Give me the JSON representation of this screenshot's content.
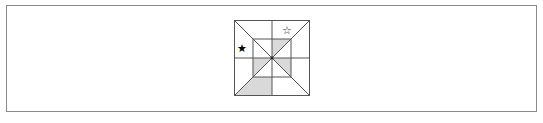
{
  "figure": {
    "outer_square": {
      "x": 234,
      "y": 20,
      "size": 76
    },
    "inner_square": {
      "x": 253,
      "y": 39,
      "size": 38
    },
    "line_color": "#555555",
    "shade_color": "#d9d9d9",
    "symbols": [
      {
        "name": "filled-star",
        "glyph": "★",
        "x": 242,
        "y": 48,
        "color": "#000000"
      },
      {
        "name": "hollow-star",
        "glyph": "☆",
        "x": 287,
        "y": 30,
        "color": "#333333"
      }
    ],
    "shaded_regions": [
      {
        "name": "top-right-inner-triangle",
        "points": "272,39 291,39 272,58"
      },
      {
        "name": "bottom-left-inner-triangle",
        "points": "253,58 272,58 253,77"
      },
      {
        "name": "bottom-right-inner-triangle",
        "points": "272,58 291,58 291,77"
      },
      {
        "name": "bottom-left-trapezoid",
        "points": "234,96 253,77 272,77 272,96"
      }
    ]
  }
}
